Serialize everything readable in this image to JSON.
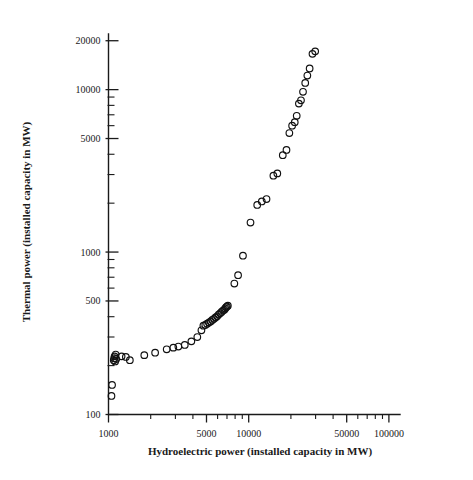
{
  "chart_data": {
    "type": "scatter",
    "title": "",
    "xlabel": "Hydroelectric power (installed capacity in MW)",
    "ylabel": "Thermal power (installed capacity in MW)",
    "xscale": "log",
    "yscale": "log",
    "xlim": [
      1000,
      120000
    ],
    "ylim": [
      100,
      22000
    ],
    "grid": false,
    "legend": null,
    "marker": "open-circle",
    "xticks": [
      1000,
      5000,
      10000,
      50000,
      100000
    ],
    "xtick_labels": [
      "1000",
      "5000",
      "10000",
      "50000",
      "100000"
    ],
    "yticks": [
      100,
      500,
      1000,
      5000,
      10000,
      20000
    ],
    "ytick_labels": [
      "100",
      "500",
      "1000",
      "5000",
      "10000",
      "20000"
    ],
    "x_minor_ticks": [
      2000,
      3000,
      4000,
      6000,
      7000,
      8000,
      9000,
      20000,
      30000,
      40000,
      60000,
      70000,
      80000,
      90000
    ],
    "y_minor_ticks": [
      200,
      300,
      400,
      600,
      700,
      800,
      900,
      2000,
      3000,
      4000,
      6000,
      7000,
      8000,
      9000
    ],
    "points": [
      {
        "x": 1050,
        "y": 130
      },
      {
        "x": 1060,
        "y": 152
      },
      {
        "x": 1090,
        "y": 216
      },
      {
        "x": 1100,
        "y": 222
      },
      {
        "x": 1105,
        "y": 228
      },
      {
        "x": 1115,
        "y": 212
      },
      {
        "x": 1125,
        "y": 234
      },
      {
        "x": 1135,
        "y": 220
      },
      {
        "x": 1240,
        "y": 228
      },
      {
        "x": 1330,
        "y": 226
      },
      {
        "x": 1420,
        "y": 216
      },
      {
        "x": 1800,
        "y": 232
      },
      {
        "x": 2150,
        "y": 240
      },
      {
        "x": 2600,
        "y": 252
      },
      {
        "x": 2900,
        "y": 258
      },
      {
        "x": 3150,
        "y": 262
      },
      {
        "x": 3500,
        "y": 268
      },
      {
        "x": 3900,
        "y": 282
      },
      {
        "x": 4300,
        "y": 300
      },
      {
        "x": 4600,
        "y": 330
      },
      {
        "x": 4750,
        "y": 352
      },
      {
        "x": 4900,
        "y": 356
      },
      {
        "x": 5050,
        "y": 362
      },
      {
        "x": 5200,
        "y": 368
      },
      {
        "x": 5350,
        "y": 374
      },
      {
        "x": 5500,
        "y": 382
      },
      {
        "x": 5650,
        "y": 388
      },
      {
        "x": 5800,
        "y": 396
      },
      {
        "x": 5950,
        "y": 402
      },
      {
        "x": 6100,
        "y": 412
      },
      {
        "x": 6250,
        "y": 420
      },
      {
        "x": 6400,
        "y": 428
      },
      {
        "x": 6550,
        "y": 436
      },
      {
        "x": 6700,
        "y": 442
      },
      {
        "x": 6800,
        "y": 450
      },
      {
        "x": 6900,
        "y": 458
      },
      {
        "x": 7000,
        "y": 462
      },
      {
        "x": 7100,
        "y": 468
      },
      {
        "x": 7900,
        "y": 640
      },
      {
        "x": 8400,
        "y": 720
      },
      {
        "x": 9100,
        "y": 950
      },
      {
        "x": 10300,
        "y": 1520
      },
      {
        "x": 11500,
        "y": 1950
      },
      {
        "x": 12400,
        "y": 2050
      },
      {
        "x": 13400,
        "y": 2120
      },
      {
        "x": 15000,
        "y": 2950
      },
      {
        "x": 16000,
        "y": 3050
      },
      {
        "x": 17500,
        "y": 3950
      },
      {
        "x": 18600,
        "y": 4250
      },
      {
        "x": 19500,
        "y": 5400
      },
      {
        "x": 20400,
        "y": 6000
      },
      {
        "x": 21300,
        "y": 6300
      },
      {
        "x": 22000,
        "y": 6900
      },
      {
        "x": 22800,
        "y": 8200
      },
      {
        "x": 23600,
        "y": 8600
      },
      {
        "x": 24400,
        "y": 9700
      },
      {
        "x": 25300,
        "y": 11000
      },
      {
        "x": 26200,
        "y": 12200
      },
      {
        "x": 27200,
        "y": 13500
      },
      {
        "x": 28500,
        "y": 16600
      },
      {
        "x": 29800,
        "y": 17200
      }
    ]
  },
  "figure": {
    "background_color": "#ffffff",
    "marker_color": "#111111",
    "axis_color": "#1a1a1a"
  }
}
